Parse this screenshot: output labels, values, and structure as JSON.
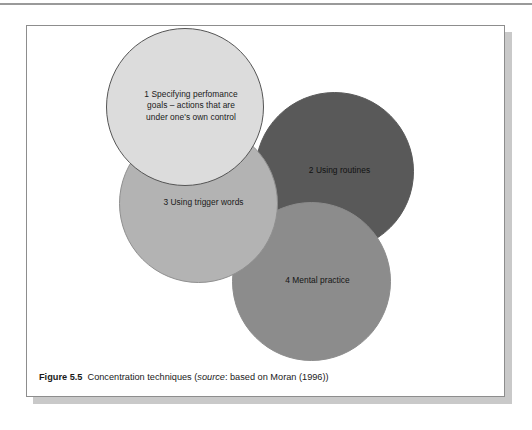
{
  "page": {
    "background": "#ffffff",
    "top_rule_color": "#9a9a9a"
  },
  "figure": {
    "frame_border_color": "#8d8d8d",
    "shadow_color": "#c9c9c9",
    "caption": {
      "label": "Figure 5.5",
      "title": "Concentration techniques ",
      "source_open": "(",
      "source_word": "source",
      "source_rest": ": based on Moran (1996))"
    }
  },
  "chart_data": {
    "type": "diagram",
    "title": "Concentration techniques",
    "subtype": "overlapping-circles",
    "bubbles": [
      {
        "index": 1,
        "label": "1 Specifying perfomance\ngoals – actions that are\nunder one's own control",
        "fill": "#dcdcdc",
        "stroke": "#555555",
        "text_color": "#1a1a1a",
        "cx": 158,
        "cy": 81,
        "r": 79
      },
      {
        "index": 2,
        "label": "2 Using routines",
        "fill": "#595959",
        "stroke": "#595959",
        "text_color": "#111111",
        "cx": 307,
        "cy": 145,
        "r": 79
      },
      {
        "index": 3,
        "label": "3 Using trigger words",
        "fill": "#b3b3b3",
        "stroke": "#8f8f8f",
        "text_color": "#1a1a1a",
        "cx": 171,
        "cy": 177,
        "r": 79
      },
      {
        "index": 4,
        "label": "4 Mental practice",
        "fill": "#8c8c8c",
        "stroke": "#8c8c8c",
        "text_color": "#151515",
        "cx": 284,
        "cy": 255,
        "r": 79
      }
    ]
  }
}
